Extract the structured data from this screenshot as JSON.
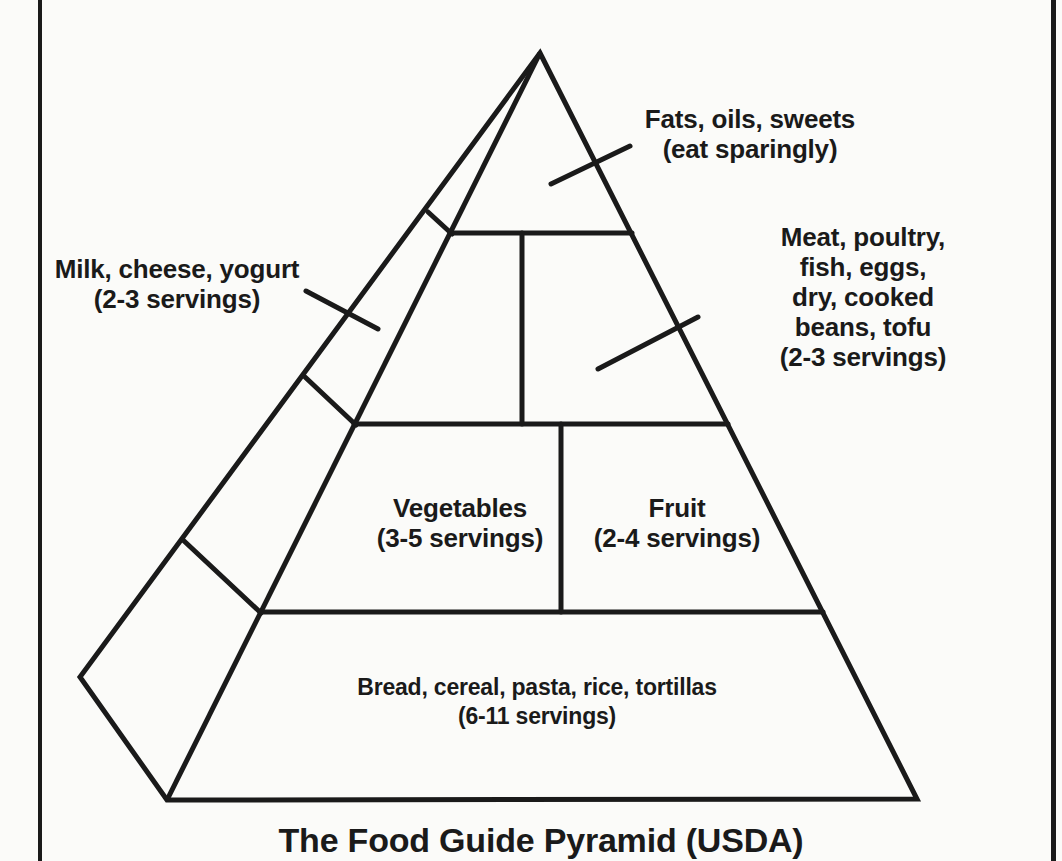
{
  "figure": {
    "title": "The Food Guide Pyramid (USDA)",
    "type": "food-guide-pyramid-diagram"
  },
  "sections": [
    {
      "id": "fats-oils-sweets",
      "group": "Fats, oils, sweets",
      "servings": "eat sparingly",
      "lines": [
        "Fats, oils, sweets",
        "(eat sparingly)"
      ]
    },
    {
      "id": "milk-cheese-yogurt",
      "group": "Milk, cheese, yogurt",
      "servings": "2-3 servings",
      "lines": [
        "Milk, cheese, yogurt",
        "(2-3 servings)"
      ]
    },
    {
      "id": "meat-poultry-fish-eggs-beans-tofu",
      "group": "Meat, poultry, fish, eggs, dry, cooked beans, tofu",
      "servings": "2-3 servings",
      "lines": [
        "Meat, poultry, fish, eggs,",
        "dry, cooked beans, tofu",
        "(2-3 servings)"
      ]
    },
    {
      "id": "vegetables",
      "group": "Vegetables",
      "servings": "3-5 servings",
      "lines": [
        "Vegetables",
        "(3-5 servings)"
      ]
    },
    {
      "id": "fruit",
      "group": "Fruit",
      "servings": "2-4 servings",
      "lines": [
        "Fruit",
        "(2-4 servings)"
      ]
    },
    {
      "id": "bread-cereal-pasta-rice-tortillas",
      "group": "Bread, cereal, pasta, rice, tortillas",
      "servings": "6-11 servings",
      "lines": [
        "Bread, cereal, pasta, rice, tortillas",
        "(6-11 servings)"
      ]
    }
  ],
  "colors": {
    "ink": "#1a1a1a",
    "paper": "#fbfbf9"
  }
}
